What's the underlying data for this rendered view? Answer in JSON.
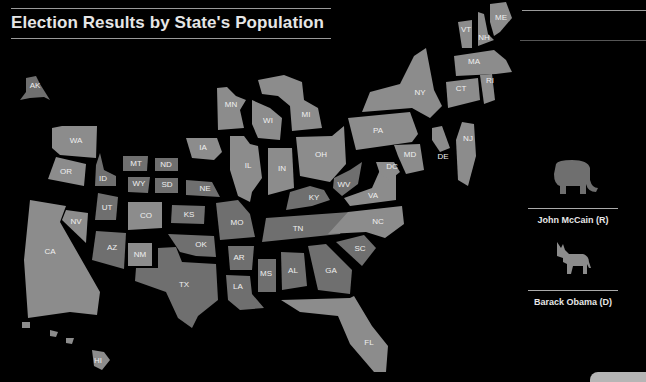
{
  "title": "Election Results by State's Population",
  "legend": {
    "republican": {
      "label": "John McCain (R)",
      "icon": "elephant-icon",
      "color": "#6f6f6f"
    },
    "democrat": {
      "label": "Barack Obama (D)",
      "icon": "donkey-icon",
      "color": "#8c8c8c"
    }
  },
  "states": [
    {
      "abbr": "AK",
      "party": "R"
    },
    {
      "abbr": "WA",
      "party": "D"
    },
    {
      "abbr": "OR",
      "party": "D"
    },
    {
      "abbr": "CA",
      "party": "D"
    },
    {
      "abbr": "NV",
      "party": "D"
    },
    {
      "abbr": "ID",
      "party": "R"
    },
    {
      "abbr": "MT",
      "party": "R"
    },
    {
      "abbr": "WY",
      "party": "R"
    },
    {
      "abbr": "UT",
      "party": "R"
    },
    {
      "abbr": "CO",
      "party": "D"
    },
    {
      "abbr": "AZ",
      "party": "R"
    },
    {
      "abbr": "NM",
      "party": "D"
    },
    {
      "abbr": "ND",
      "party": "R"
    },
    {
      "abbr": "SD",
      "party": "R"
    },
    {
      "abbr": "NE",
      "party": "R"
    },
    {
      "abbr": "KS",
      "party": "R"
    },
    {
      "abbr": "OK",
      "party": "R"
    },
    {
      "abbr": "TX",
      "party": "R"
    },
    {
      "abbr": "MN",
      "party": "D"
    },
    {
      "abbr": "IA",
      "party": "D"
    },
    {
      "abbr": "MO",
      "party": "R"
    },
    {
      "abbr": "AR",
      "party": "R"
    },
    {
      "abbr": "LA",
      "party": "R"
    },
    {
      "abbr": "WI",
      "party": "D"
    },
    {
      "abbr": "IL",
      "party": "D"
    },
    {
      "abbr": "MI",
      "party": "D"
    },
    {
      "abbr": "IN",
      "party": "D"
    },
    {
      "abbr": "OH",
      "party": "D"
    },
    {
      "abbr": "KY",
      "party": "R"
    },
    {
      "abbr": "TN",
      "party": "R"
    },
    {
      "abbr": "MS",
      "party": "R"
    },
    {
      "abbr": "AL",
      "party": "R"
    },
    {
      "abbr": "GA",
      "party": "R"
    },
    {
      "abbr": "FL",
      "party": "D"
    },
    {
      "abbr": "SC",
      "party": "R"
    },
    {
      "abbr": "NC",
      "party": "D"
    },
    {
      "abbr": "VA",
      "party": "D"
    },
    {
      "abbr": "WV",
      "party": "R"
    },
    {
      "abbr": "DC",
      "party": "D"
    },
    {
      "abbr": "MD",
      "party": "D"
    },
    {
      "abbr": "DE",
      "party": "D"
    },
    {
      "abbr": "NJ",
      "party": "D"
    },
    {
      "abbr": "PA",
      "party": "D"
    },
    {
      "abbr": "NY",
      "party": "D"
    },
    {
      "abbr": "CT",
      "party": "D"
    },
    {
      "abbr": "RI",
      "party": "D"
    },
    {
      "abbr": "MA",
      "party": "D"
    },
    {
      "abbr": "VT",
      "party": "D"
    },
    {
      "abbr": "NH",
      "party": "D"
    },
    {
      "abbr": "ME",
      "party": "D"
    },
    {
      "abbr": "HI",
      "party": "D"
    }
  ]
}
